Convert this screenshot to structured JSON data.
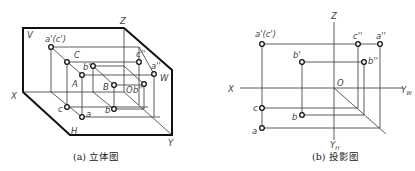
{
  "figure_a": {
    "caption": "(a) 立体图",
    "plane_labels": {
      "V": "V",
      "H": "H",
      "W": "W"
    },
    "axis_labels": {
      "X": "X",
      "Y": "Y",
      "Z": "Z"
    },
    "origin_label": "O",
    "points": {
      "a_v": "a'(c')",
      "C": "C",
      "b_v": "b'",
      "A": "A",
      "B": "B",
      "b_w": "b''",
      "c_w": "c''",
      "a_w": "a''",
      "c_h": "c",
      "a_h": "a",
      "b_h": "b"
    }
  },
  "figure_b": {
    "caption": "(b) 投影图",
    "axis_labels": {
      "X": "X",
      "Z": "Z",
      "Yw": "Y",
      "Yw_sub": "W",
      "Yh": "Y",
      "Yh_sub": "H"
    },
    "origin_label": "O",
    "points": {
      "a_v": "a'(c')",
      "c_w": "c''",
      "a_w": "a''",
      "b_v": "b'",
      "b_w": "b''",
      "c_h": "c",
      "b_h": "b",
      "a_h": "a"
    }
  },
  "colors": {
    "line": "#333333",
    "outline": "#111111",
    "label": "#444444",
    "background": "#ffffff"
  }
}
